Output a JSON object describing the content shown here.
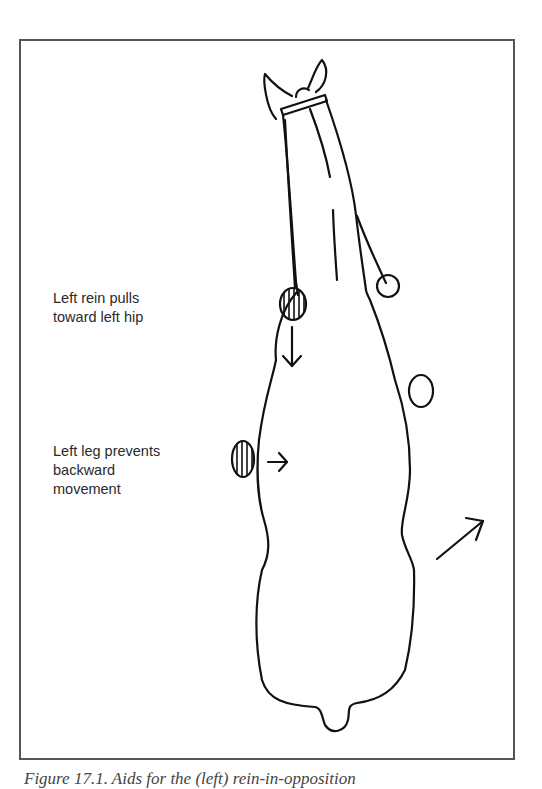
{
  "figure": {
    "labels": {
      "rein": "Left rein pulls\ntoward left hip",
      "leg": "Left leg prevents\nbackward\nmovement"
    },
    "caption": "Figure 17.1. Aids for the (left) rein-in-opposition",
    "markers": [
      {
        "name": "left-rein-aid",
        "style": "hatched"
      },
      {
        "name": "left-leg-aid",
        "style": "hatched"
      },
      {
        "name": "right-rein-aid",
        "style": "open"
      },
      {
        "name": "right-leg-aid",
        "style": "open"
      }
    ],
    "arrows": [
      {
        "name": "rein-pull-arrow",
        "direction": "down"
      },
      {
        "name": "leg-push-arrow",
        "direction": "right"
      },
      {
        "name": "movement-arrow",
        "direction": "up-right"
      }
    ]
  }
}
